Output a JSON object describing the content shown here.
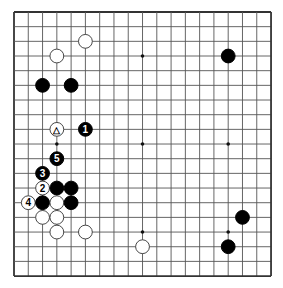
{
  "board": {
    "size": 19,
    "origin_x": 14,
    "origin_y": 12,
    "spacing_x": 14.28,
    "spacing_y": 14.67,
    "line_color": "#555555",
    "edge_color": "#333333",
    "hoshi": [
      [
        3,
        3
      ],
      [
        9,
        3
      ],
      [
        15,
        3
      ],
      [
        3,
        9
      ],
      [
        9,
        9
      ],
      [
        15,
        9
      ],
      [
        3,
        15
      ],
      [
        9,
        15
      ],
      [
        15,
        15
      ]
    ]
  },
  "stones": [
    {
      "col": 5,
      "row": 2,
      "color": "white",
      "label": ""
    },
    {
      "col": 3,
      "row": 3,
      "color": "white",
      "label": ""
    },
    {
      "col": 2,
      "row": 5,
      "color": "black",
      "label": ""
    },
    {
      "col": 4,
      "row": 5,
      "color": "black",
      "label": ""
    },
    {
      "col": 15,
      "row": 3,
      "color": "black",
      "label": ""
    },
    {
      "col": 3,
      "row": 8,
      "color": "white",
      "label": "△"
    },
    {
      "col": 5,
      "row": 8,
      "color": "black",
      "label": "1"
    },
    {
      "col": 3,
      "row": 10,
      "color": "black",
      "label": "5"
    },
    {
      "col": 2,
      "row": 11,
      "color": "black",
      "label": "3"
    },
    {
      "col": 2,
      "row": 12,
      "color": "white",
      "label": "2"
    },
    {
      "col": 3,
      "row": 12,
      "color": "black",
      "label": ""
    },
    {
      "col": 4,
      "row": 12,
      "color": "black",
      "label": ""
    },
    {
      "col": 1,
      "row": 13,
      "color": "white",
      "label": "4"
    },
    {
      "col": 2,
      "row": 13,
      "color": "black",
      "label": ""
    },
    {
      "col": 3,
      "row": 13,
      "color": "white",
      "label": ""
    },
    {
      "col": 4,
      "row": 13,
      "color": "black",
      "label": ""
    },
    {
      "col": 2,
      "row": 14,
      "color": "white",
      "label": ""
    },
    {
      "col": 3,
      "row": 14,
      "color": "white",
      "label": ""
    },
    {
      "col": 3,
      "row": 15,
      "color": "white",
      "label": ""
    },
    {
      "col": 5,
      "row": 15,
      "color": "white",
      "label": ""
    },
    {
      "col": 9,
      "row": 16,
      "color": "white",
      "label": ""
    },
    {
      "col": 16,
      "row": 14,
      "color": "black",
      "label": ""
    },
    {
      "col": 15,
      "row": 16,
      "color": "black",
      "label": ""
    }
  ]
}
